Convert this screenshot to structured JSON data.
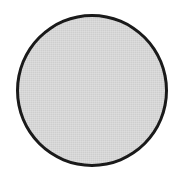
{
  "diagram": {
    "shapes": [
      {
        "type": "circle",
        "fill_color": "#d6d6d6",
        "stroke_color": "#1a1a1a",
        "stroke_width": 3
      }
    ]
  }
}
